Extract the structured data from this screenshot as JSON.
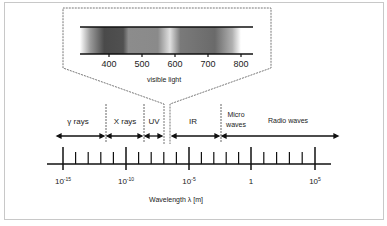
{
  "diagram": {
    "inset": {
      "caption": "visible light",
      "ticks": [
        "400",
        "500",
        "600",
        "700",
        "800"
      ]
    },
    "regions": [
      {
        "label": "γ rays"
      },
      {
        "label": "X rays"
      },
      {
        "label": "UV"
      },
      {
        "label": "IR"
      },
      {
        "label_line1": "Micro",
        "label_line2": "waves"
      },
      {
        "label": "Radio waves"
      }
    ],
    "axis": {
      "ticks": [
        {
          "base": "10",
          "exp": "-15"
        },
        {
          "base": "10",
          "exp": "-10"
        },
        {
          "base": "10",
          "exp": "-5"
        },
        {
          "base": "1",
          "exp": ""
        },
        {
          "base": "10",
          "exp": "5"
        }
      ],
      "label": "Wavelength  λ [m]"
    }
  }
}
